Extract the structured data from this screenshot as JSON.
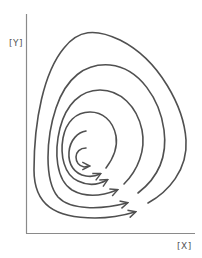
{
  "diagram": {
    "type": "phase-portrait-spiral",
    "axes": {
      "y_label": "[Y]",
      "x_label": "[X]"
    },
    "stroke_color": "#505050",
    "axis_color": "#8a8a8a",
    "trajectory_count": 6,
    "direction": "clockwise-inward-spiral-with-arrows"
  }
}
